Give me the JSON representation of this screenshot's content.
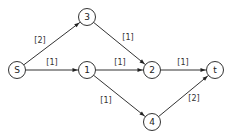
{
  "diagram": {
    "type": "directed-network",
    "nodes": [
      {
        "id": "S",
        "label": "S"
      },
      {
        "id": "3",
        "label": "3"
      },
      {
        "id": "1",
        "label": "1"
      },
      {
        "id": "2",
        "label": "2"
      },
      {
        "id": "t",
        "label": "t"
      },
      {
        "id": "4",
        "label": "4"
      }
    ],
    "edges": [
      {
        "from": "S",
        "to": "3",
        "label": "[2]"
      },
      {
        "from": "S",
        "to": "1",
        "label": "[1]"
      },
      {
        "from": "3",
        "to": "2",
        "label": "[1]"
      },
      {
        "from": "1",
        "to": "2",
        "label": "[1]"
      },
      {
        "from": "1",
        "to": "4",
        "label": "[1]"
      },
      {
        "from": "2",
        "to": "t",
        "label": "[1]"
      },
      {
        "from": "4",
        "to": "t",
        "label": "[2]"
      }
    ]
  }
}
